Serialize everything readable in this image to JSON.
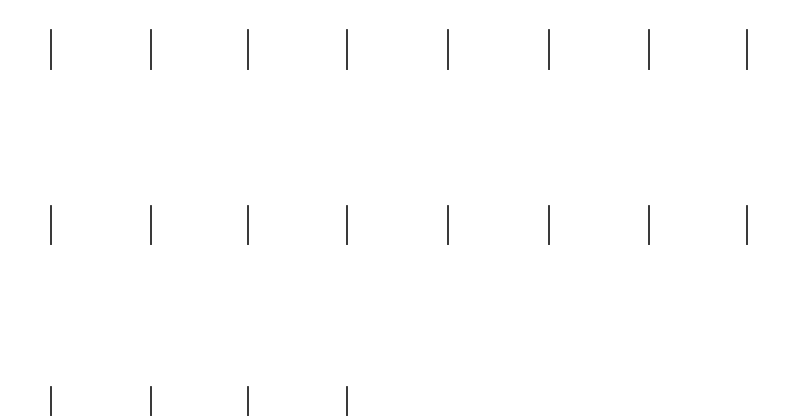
{
  "canvas": {
    "width": 795,
    "height": 416,
    "background": "#ffffff"
  },
  "bar_style": {
    "color": "#3a3a3a",
    "width_px": 2
  },
  "rows": [
    {
      "y_top": 29,
      "height": 41,
      "x_positions": [
        50,
        150,
        247,
        346,
        447,
        548,
        648,
        746
      ]
    },
    {
      "y_top": 205,
      "height": 40,
      "x_positions": [
        50,
        150,
        247,
        346,
        447,
        548,
        648,
        746
      ]
    },
    {
      "y_top": 386,
      "height": 30,
      "x_positions": [
        50,
        150,
        247,
        346
      ]
    }
  ],
  "bar_count": 20
}
